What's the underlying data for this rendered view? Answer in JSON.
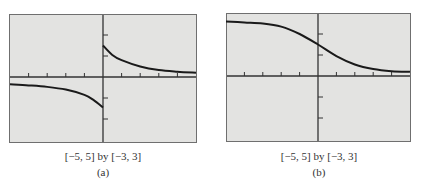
{
  "chart_data": [
    {
      "type": "line",
      "label": "(a)",
      "window_caption": "[−5, 5] by [−3, 3]",
      "xlim": [
        -5,
        5
      ],
      "ylim": [
        -3,
        3
      ],
      "xticks": [
        -4,
        -3,
        -2,
        -1,
        1,
        2,
        3,
        4
      ],
      "yticks": [
        -2,
        -1,
        1,
        2
      ],
      "grid": false,
      "description": "Two-branch curve with a vertical jump at x=0: left branch decreasing from about -0.4 toward about -1.4 as x approaches 0 from the left; right branch decreasing from about 1.5 at x=0+ toward about 0.2 as x approaches 5.",
      "series": [
        {
          "name": "left branch",
          "x": [
            -5,
            -4,
            -3,
            -2,
            -1,
            -0.5,
            0
          ],
          "y": [
            -0.35,
            -0.4,
            -0.47,
            -0.6,
            -0.85,
            -1.1,
            -1.45
          ]
        },
        {
          "name": "right branch",
          "x": [
            0,
            0.5,
            1,
            2,
            3,
            4,
            5
          ],
          "y": [
            1.5,
            1.05,
            0.8,
            0.5,
            0.33,
            0.25,
            0.2
          ]
        }
      ]
    },
    {
      "type": "line",
      "label": "(b)",
      "window_caption": "[−5, 5] by [−3, 3]",
      "xlim": [
        -5,
        5
      ],
      "ylim": [
        -3,
        3
      ],
      "xticks": [
        -4,
        -3,
        -2,
        -1,
        1,
        2,
        3,
        4
      ],
      "yticks": [
        -2,
        -1,
        1,
        2
      ],
      "grid": false,
      "description": "Smooth decreasing S-shaped curve from about 2.6 at x=-5 to about 0.2 at x=5, crossing the y-axis near 1.5.",
      "series": [
        {
          "name": "curve",
          "x": [
            -5,
            -4,
            -3,
            -2,
            -1,
            0,
            1,
            2,
            3,
            4,
            5
          ],
          "y": [
            2.6,
            2.55,
            2.5,
            2.35,
            2.0,
            1.5,
            0.95,
            0.55,
            0.33,
            0.23,
            0.2
          ]
        }
      ]
    }
  ],
  "panels": [
    {
      "caption": "[−5, 5] by [−3, 3]",
      "label": "(a)"
    },
    {
      "caption": "[−5, 5] by [−3, 3]",
      "label": "(b)"
    }
  ]
}
